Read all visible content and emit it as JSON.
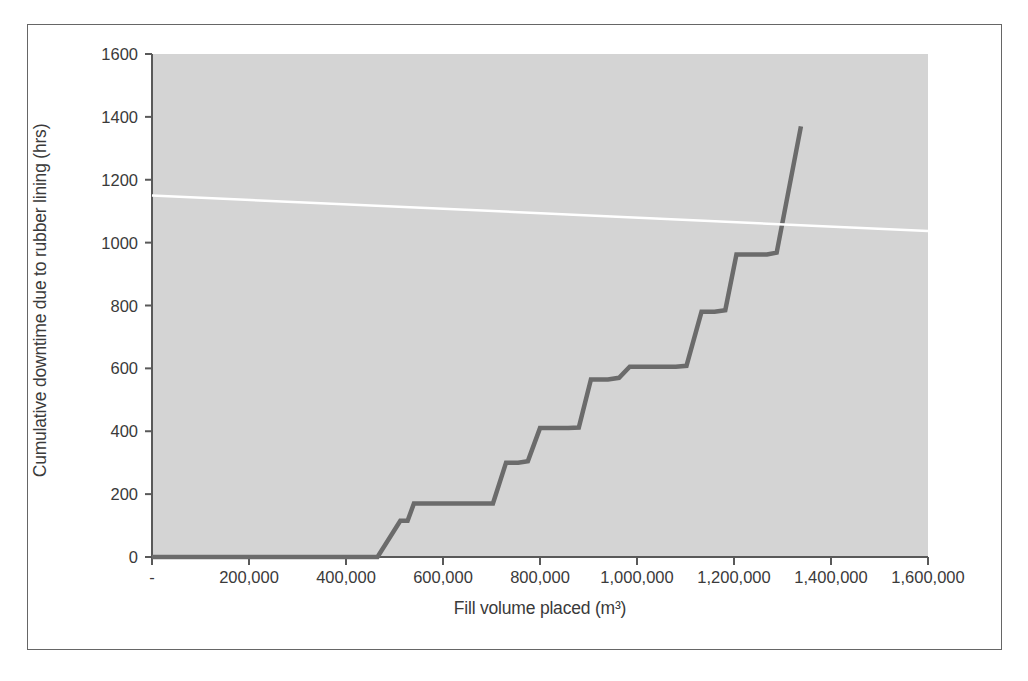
{
  "figure": {
    "background": "#ffffff",
    "plot_background": "#d4d4d4",
    "border_color": "#666666"
  },
  "chart_data": {
    "type": "line",
    "title": "",
    "subtitle": "",
    "xlabel": "Fill volume placed (m³)",
    "ylabel": "Cumulative downtime due to rubber lining (hrs)",
    "xlim": [
      0,
      1600000
    ],
    "ylim": [
      0,
      1600
    ],
    "xticks": [
      0,
      200000,
      400000,
      600000,
      800000,
      1000000,
      1200000,
      1400000,
      1600000
    ],
    "xtick_labels": [
      "-",
      "200,000",
      "400,000",
      "600,000",
      "800,000",
      "1,000,000",
      "1,200,000",
      "1,400,000",
      "1,600,000"
    ],
    "yticks": [
      0,
      200,
      400,
      600,
      800,
      1000,
      1200,
      1400,
      1600
    ],
    "ytick_labels": [
      "0",
      "200",
      "400",
      "600",
      "800",
      "1000",
      "1200",
      "1400",
      "1600"
    ],
    "grid": false,
    "legend": "none",
    "series": [
      {
        "name": "Cumulative downtime (step)",
        "type": "step",
        "color": "#6b6b6b",
        "line_width": 4.5,
        "points": [
          [
            0,
            0
          ],
          [
            465000,
            0
          ],
          [
            512000,
            115
          ],
          [
            527000,
            115
          ],
          [
            540000,
            170
          ],
          [
            592000,
            170
          ],
          [
            703000,
            170
          ],
          [
            730000,
            300
          ],
          [
            755000,
            300
          ],
          [
            775000,
            305
          ],
          [
            800000,
            410
          ],
          [
            858000,
            410
          ],
          [
            880000,
            412
          ],
          [
            905000,
            565
          ],
          [
            940000,
            565
          ],
          [
            963000,
            570
          ],
          [
            985000,
            605
          ],
          [
            1080000,
            605
          ],
          [
            1102000,
            608
          ],
          [
            1133000,
            780
          ],
          [
            1160000,
            780
          ],
          [
            1182000,
            785
          ],
          [
            1205000,
            962
          ],
          [
            1268000,
            962
          ],
          [
            1288000,
            968
          ],
          [
            1338000,
            1370
          ]
        ]
      },
      {
        "name": "Linear trend",
        "type": "line",
        "color": "#ffffff",
        "line_width": 2.5,
        "points": [
          [
            0,
            1150
          ],
          [
            1600000,
            1037
          ]
        ]
      }
    ]
  }
}
